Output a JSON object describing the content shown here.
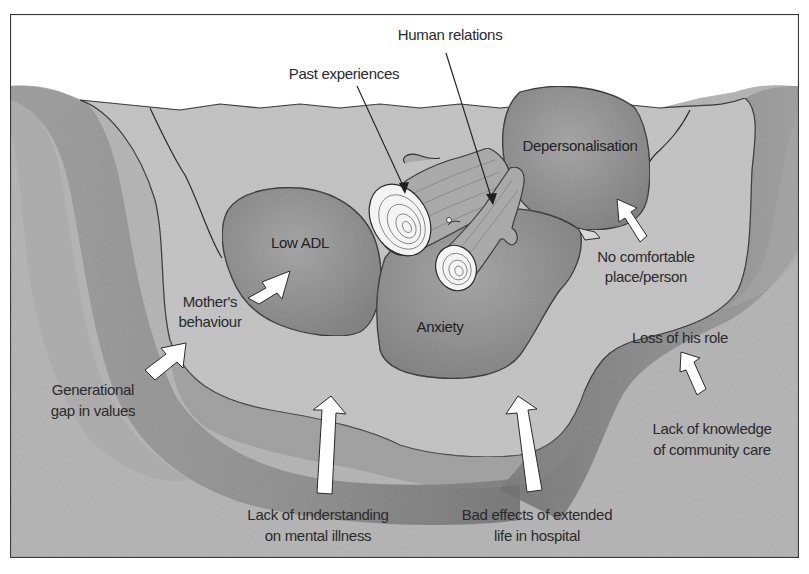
{
  "diagram": {
    "type": "well-metaphor",
    "colors": {
      "background": "#ffffff",
      "ground": "#b8b8b8",
      "ground_shadow": "#7a7a7a",
      "well_water": "#c4c4c4",
      "boulder": "#8f8f8f",
      "log": "#a8a8a8",
      "log_end": "#f4f4f4",
      "arrow_fill": "#ffffff",
      "outline": "#2b2b2b"
    }
  },
  "log_labels": {
    "human_relations": "Human relations",
    "past_experiences": "Past experiences"
  },
  "boulders": {
    "depersonalisation": "Depersonalisation",
    "low_adl": "Low ADL",
    "anxiety": "Anxiety"
  },
  "factors": {
    "no_comfortable": [
      "No comfortable",
      "place/person"
    ],
    "mothers_behaviour": [
      "Mother's",
      "behaviour"
    ],
    "loss_of_role": [
      "Loss of his role"
    ],
    "generational_gap": [
      "Generational",
      "gap in values"
    ],
    "lack_of_knowledge": [
      "Lack of knowledge",
      "of community care"
    ],
    "lack_of_understanding": [
      "Lack of understanding",
      "on mental illness"
    ],
    "bad_effects": [
      "Bad effects of extended",
      "life in hospital"
    ]
  }
}
